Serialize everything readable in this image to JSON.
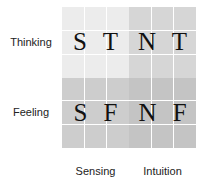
{
  "diagram": {
    "rows": [
      {
        "label": "Thinking"
      },
      {
        "label": "Feeling"
      }
    ],
    "columns": [
      {
        "label": "Sensing"
      },
      {
        "label": "Intuition"
      }
    ],
    "quadrants": [
      {
        "label": "S T",
        "row": "Thinking",
        "column": "Sensing",
        "color": "#ececec"
      },
      {
        "label": "N T",
        "row": "Thinking",
        "column": "Intuition",
        "color": "#d6d6d6"
      },
      {
        "label": "S F",
        "row": "Feeling",
        "column": "Sensing",
        "color": "#cdcdcd"
      },
      {
        "label": "N F",
        "row": "Feeling",
        "column": "Intuition",
        "color": "#c4c4c4"
      }
    ]
  }
}
